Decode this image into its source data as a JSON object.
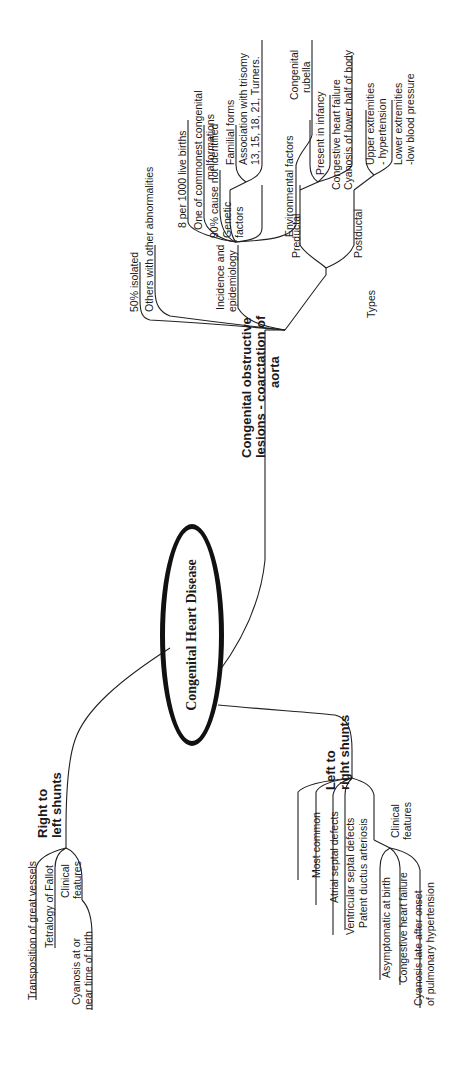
{
  "center": {
    "label": "Congenital Heart Disease"
  },
  "branches": {
    "coarctation": {
      "label": "Congenital obstructive lesions - coarctation of aorta",
      "lines": [
        "Congenital obstructive",
        "lesions - coarctation of",
        "aorta"
      ],
      "children": {
        "isolated": "50% isolated",
        "others": "Others with other abnormalities",
        "incidence": {
          "label": "Incidence and epidemiology",
          "lines": [
            "Incidence and",
            "epidemiology"
          ],
          "children": {
            "births": "8 per 1000 live births",
            "commonest": [
              "One of commonest congenital",
              "malformations"
            ],
            "cause": "90% cause not identified",
            "genetic": {
              "lines": [
                "Genetic",
                "factors"
              ],
              "children": {
                "familial": "Familial forms",
                "trisomy": [
                  "Association with trisomy",
                  "13, 15, 18, 21, Turners."
                ]
              }
            },
            "environmental": {
              "label": "Environmental factors",
              "children": {
                "rubella": [
                  "Congenital",
                  "rubella"
                ]
              }
            }
          }
        },
        "types": {
          "label": "Types",
          "children": {
            "preductal": {
              "label": "Preductal",
              "children": [
                "Present in infancy",
                "Congestive heart failure",
                "Cyanosis of lower half of body"
              ]
            },
            "postductal": {
              "label": "Postductal",
              "children": [
                [
                  "Upper extremities",
                  "- hypertension"
                ],
                [
                  "Lower extremities",
                  "-low blood pressure"
                ]
              ]
            }
          }
        }
      }
    },
    "right_to_left": {
      "lines": [
        "Right to",
        "left shunts"
      ],
      "children": {
        "tga": "Transposition of great vessels",
        "tof": "Tetralogy of Fallot",
        "clinical": {
          "lines": [
            "Clinical",
            "features"
          ],
          "children": {
            "cyanosis": [
              "Cyanosis at or",
              "near time of birth"
            ]
          }
        }
      }
    },
    "left_to_right": {
      "lines": [
        "Left to",
        "right shunts"
      ],
      "children": {
        "most_common": "Most common",
        "asd": "Atrial septal defects",
        "vsd": "Ventricular septal defects",
        "pda": "Patent ductus arteriosis",
        "clinical": {
          "lines": [
            "Clinical",
            "features"
          ],
          "children": {
            "asymptomatic": "Asymptomatic at birth",
            "chf": "Congestive heart failure",
            "cyanosis": [
              "Cyanosis late after onset",
              "of pulmonary hypertension"
            ]
          }
        }
      }
    }
  }
}
